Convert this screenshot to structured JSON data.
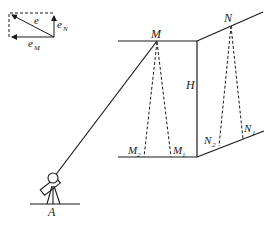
{
  "diagram": {
    "type": "surveying-geometry",
    "vector_inset": {
      "labels": {
        "resultant": "e",
        "north": "e",
        "north_sub": "N",
        "m": "e",
        "m_sub": "M"
      }
    },
    "labels": {
      "M": "M",
      "N": "N",
      "H": "H",
      "M1": "M",
      "M1_sub": "1",
      "M2": "M",
      "M2_sub": "2",
      "N1": "N",
      "N1_sub": "1",
      "N2": "N",
      "N2_sub": "2",
      "A": "A"
    },
    "colors": {
      "stroke": "#1a1a1a",
      "background": "#ffffff"
    }
  }
}
